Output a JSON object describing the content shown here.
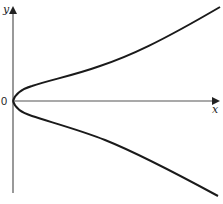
{
  "diagram": {
    "axes": {
      "x_label": "x",
      "y_label": "y",
      "origin_label": "0"
    },
    "colors": {
      "axis": "#555555",
      "curve": "#1a1a1a",
      "background": "#ffffff"
    },
    "curves": [
      {
        "name": "upper-branch",
        "points_px": [
          [
            13,
            101
          ],
          [
            18,
            95
          ],
          [
            30,
            87
          ],
          [
            60,
            77
          ],
          [
            100,
            66
          ],
          [
            150,
            46
          ],
          [
            220,
            7
          ]
        ]
      },
      {
        "name": "lower-branch",
        "points_px": [
          [
            13,
            101
          ],
          [
            18,
            107
          ],
          [
            30,
            115
          ],
          [
            60,
            126
          ],
          [
            105,
            140
          ],
          [
            150,
            161
          ],
          [
            218,
            196
          ]
        ]
      }
    ]
  }
}
